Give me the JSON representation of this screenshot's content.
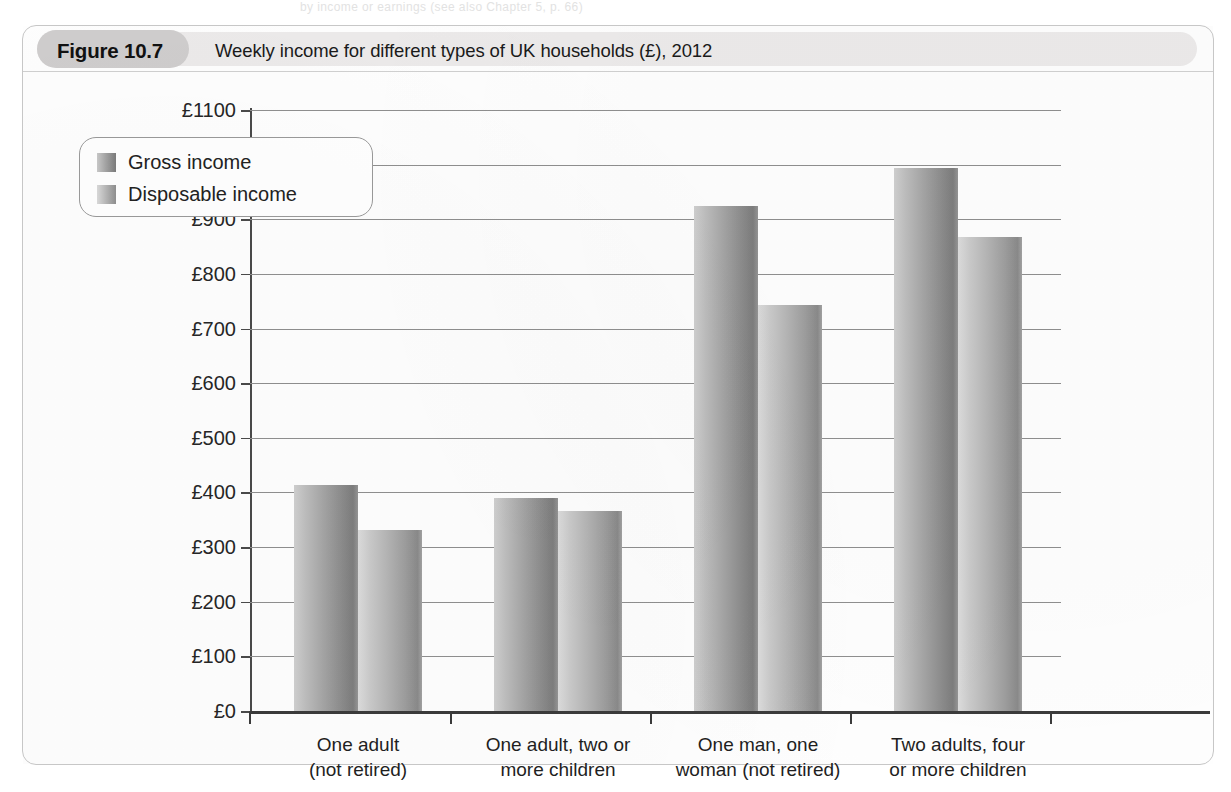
{
  "page": {
    "bleed_text": "by income or earnings (see also Chapter 5, p. 66)"
  },
  "figure": {
    "number_label": "Figure 10.7",
    "title": "Weekly income for different types of UK households (£), 2012"
  },
  "legend": {
    "items": [
      {
        "label": "Gross income",
        "swatch": "gross-swatch",
        "color": "#8e8e8e"
      },
      {
        "label": "Disposable income",
        "swatch": "disposable-swatch",
        "color": "#b5b5b5"
      }
    ]
  },
  "axis": {
    "y_tick_labels": [
      "£0",
      "£100",
      "£200",
      "£300",
      "£400",
      "£500",
      "£600",
      "£700",
      "£800",
      "£900",
      "£1000",
      "£1100"
    ],
    "x_tick_labels": [
      "One adult\n(not retired)",
      "One adult, two or\nmore children",
      "One man, one\nwoman (not retired)",
      "Two adults, four\nor more children"
    ]
  },
  "chart_data": {
    "type": "bar",
    "title": "Weekly income for different types of UK households (£), 2012",
    "xlabel": "",
    "ylabel": "",
    "ylim": [
      0,
      1100
    ],
    "ytick_step": 100,
    "grid": true,
    "legend_position": "upper-left-inside",
    "currency": "£",
    "categories": [
      "One adult (not retired)",
      "One adult, two or more children",
      "One man, one woman (not retired)",
      "Two adults, four or more children"
    ],
    "series": [
      {
        "name": "Gross income",
        "values": [
          413,
          389,
          925,
          993
        ]
      },
      {
        "name": "Disposable income",
        "values": [
          331,
          367,
          743,
          867
        ]
      }
    ]
  }
}
